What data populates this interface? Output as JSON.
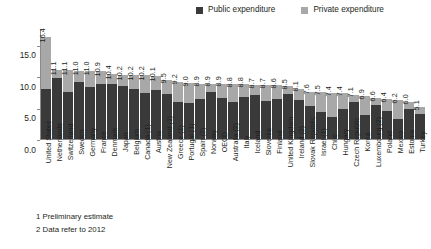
{
  "chart_data": {
    "type": "bar",
    "title": "",
    "subtitle": "",
    "xlabel": "",
    "ylabel": "",
    "ylim": [
      0,
      17.5
    ],
    "yticks": [
      "0.0",
      "5.0",
      "10.0",
      "15.0"
    ],
    "ytick_values": [
      0.0,
      5.0,
      10.0,
      15.0
    ],
    "grid": false,
    "stacked": true,
    "legend_position": "top-right",
    "legend": [
      "Public expenditure",
      "Private expenditure"
    ],
    "categories": [
      "United States",
      "Netherlands",
      "Switzerland",
      "Sweden",
      "Germany",
      "France",
      "Denmark",
      "Japan",
      "Belgium",
      "Canada (1)",
      "Austria",
      "New Zealand (1)",
      "Greece (1)",
      "Portugal (1)",
      "Spain (2)",
      "Norway",
      "OECD",
      "Australia (2)",
      "Italy",
      "Iceland",
      "Slovenia",
      "Finland",
      "United Kingdom",
      "Ireland (2)",
      "Slovak Republic",
      "Israel (1)",
      "Chile",
      "Hungary",
      "Czech Republic",
      "Korea",
      "Luxembourg (2)",
      "Poland",
      "Mexico",
      "Estonia",
      "Turkey"
    ],
    "totals": [
      16.4,
      11.1,
      11.1,
      11.0,
      11.0,
      10.9,
      10.4,
      10.2,
      10.2,
      10.2,
      10.1,
      9.5,
      9.2,
      9.0,
      8.9,
      8.9,
      8.9,
      8.8,
      8.8,
      8.7,
      8.7,
      8.6,
      8.5,
      8.1,
      7.6,
      7.5,
      7.4,
      7.4,
      7.1,
      6.9,
      6.6,
      6.4,
      6.2,
      6.0,
      5.1
    ],
    "value_labels": [
      "16.4",
      "11.1",
      "11.1",
      "11.0",
      "11.0",
      "10.9",
      "10.4",
      "10.2",
      "10.2",
      "10.2",
      "10.1",
      "9.5",
      "9.2",
      "9.0",
      "8.9",
      "8.9",
      "8.9",
      "8.8",
      "8.8",
      "8.7",
      "8.7",
      "8.6",
      "8.5",
      "8.1",
      "7.6",
      "7.5",
      "7.4",
      "7.4",
      "7.1",
      "6.9",
      "6.6",
      "6.4",
      "6.2",
      "6.0",
      "5.1"
    ],
    "series": [
      {
        "name": "Public expenditure",
        "color": "#3a3a3a",
        "values": [
          8.1,
          9.8,
          7.5,
          9.2,
          8.4,
          8.8,
          8.9,
          8.5,
          8.0,
          7.4,
          7.8,
          7.3,
          5.9,
          5.8,
          6.4,
          7.5,
          6.6,
          6.0,
          6.8,
          7.0,
          6.1,
          6.5,
          7.3,
          6.2,
          5.3,
          4.4,
          3.5,
          4.8,
          6.0,
          3.9,
          5.5,
          4.5,
          3.2,
          4.8,
          4.0
        ]
      },
      {
        "name": "Private expenditure",
        "color": "#a8a8a8",
        "values": [
          8.3,
          1.3,
          3.6,
          1.8,
          2.6,
          2.1,
          1.5,
          1.7,
          2.2,
          2.8,
          2.3,
          2.2,
          3.3,
          3.2,
          2.5,
          1.4,
          2.3,
          2.8,
          2.0,
          1.7,
          2.6,
          2.1,
          1.2,
          1.9,
          2.3,
          3.1,
          3.9,
          2.6,
          1.1,
          3.0,
          1.1,
          1.9,
          3.0,
          1.2,
          1.1
        ]
      }
    ],
    "annotations": [
      "1 Preliminary estimate",
      "2 Data refer to 2012"
    ]
  },
  "legend": {
    "items": [
      {
        "label": "Public expenditure",
        "color": "#3a3a3a"
      },
      {
        "label": "Private expenditure",
        "color": "#a8a8a8"
      }
    ]
  },
  "footnotes": [
    "1 Preliminary estimate",
    "2 Data refer to 2012"
  ],
  "colors": {
    "public": "#3a3a3a",
    "private": "#a8a8a8",
    "axis": "#8a8a8a",
    "text": "#231f20",
    "background": "#ffffff"
  }
}
